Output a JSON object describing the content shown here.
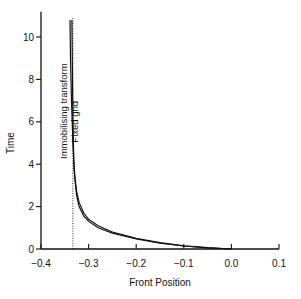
{
  "chart_data": {
    "type": "line",
    "title": "",
    "xlabel": "Front Position",
    "ylabel": "Time",
    "xlim": [
      -0.4,
      0.1
    ],
    "ylim": [
      0,
      11
    ],
    "grid": false,
    "legend": null,
    "x_ticks": [
      -0.4,
      -0.3,
      -0.2,
      -0.1,
      0.0,
      0.1
    ],
    "x_tick_labels": [
      "-0.4",
      "-0.3",
      "-0.2",
      "-0.1",
      "0.0",
      "0.1"
    ],
    "y_ticks": [
      0,
      2,
      4,
      6,
      8,
      10
    ],
    "y_tick_labels": [
      "0",
      "2",
      "4",
      "6",
      "8",
      "10"
    ],
    "series": [
      {
        "name": "Immobilising transform",
        "style": "solid",
        "x": [
          0.0,
          -0.05,
          -0.1,
          -0.15,
          -0.2,
          -0.25,
          -0.28,
          -0.3,
          -0.31,
          -0.32,
          -0.325,
          -0.33,
          -0.333,
          -0.336,
          -0.338,
          -0.339
        ],
        "y": [
          0.0,
          0.06,
          0.15,
          0.3,
          0.5,
          0.8,
          1.1,
          1.4,
          1.7,
          2.2,
          2.7,
          3.6,
          5.0,
          7.0,
          9.0,
          10.8
        ]
      },
      {
        "name": "Fixed grid",
        "style": "solid",
        "x": [
          0.0,
          -0.05,
          -0.1,
          -0.15,
          -0.2,
          -0.25,
          -0.28,
          -0.3,
          -0.31,
          -0.32,
          -0.325,
          -0.328,
          -0.331,
          -0.333,
          -0.334,
          -0.335
        ],
        "y": [
          0.0,
          0.05,
          0.14,
          0.28,
          0.47,
          0.75,
          1.0,
          1.3,
          1.55,
          2.0,
          2.5,
          3.1,
          4.2,
          6.0,
          8.5,
          10.8
        ]
      },
      {
        "name": "Asymptote",
        "style": "dotted",
        "x": [
          -0.333,
          -0.333
        ],
        "y": [
          0,
          10.9
        ]
      }
    ],
    "annotations": [
      {
        "text": "Immobilising transform",
        "x": -0.345,
        "y": 6.5,
        "rotation": -90
      },
      {
        "text": "Fixed grid",
        "x": -0.322,
        "y": 6.0,
        "rotation": -90
      }
    ]
  }
}
